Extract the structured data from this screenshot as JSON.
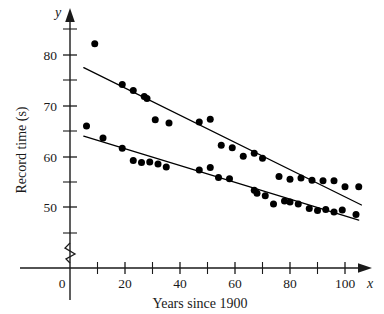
{
  "chart_data": {
    "type": "scatter",
    "title": "",
    "xlabel": "Years since 1900",
    "ylabel": "Record time (s)",
    "x_axis_name": "x",
    "y_axis_name": "y",
    "xlim": [
      0,
      108
    ],
    "ylim": [
      43,
      86
    ],
    "y_axis_break": true,
    "grid": false,
    "legend": "none",
    "x_ticks_major": [
      0,
      20,
      40,
      60,
      80,
      100
    ],
    "x_ticks_minor": [
      10,
      30,
      50,
      70,
      90
    ],
    "x_tick_labels": [
      "0",
      "20",
      "40",
      "60",
      "80",
      "100"
    ],
    "y_ticks_major": [
      50,
      60,
      70,
      80
    ],
    "y_ticks_minor": [
      45,
      55,
      65,
      75,
      85
    ],
    "y_tick_labels": [
      "50",
      "60",
      "70",
      "80"
    ],
    "series": [
      {
        "name": "upper-series",
        "points": [
          [
            9,
            82.2
          ],
          [
            19,
            74.2
          ],
          [
            23,
            73.0
          ],
          [
            27,
            71.8
          ],
          [
            28,
            71.4
          ],
          [
            31,
            67.2
          ],
          [
            36,
            66.6
          ],
          [
            47,
            66.8
          ],
          [
            51,
            67.3
          ],
          [
            55,
            62.2
          ],
          [
            59,
            61.7
          ],
          [
            63,
            60.0
          ],
          [
            67,
            60.6
          ],
          [
            70,
            59.6
          ],
          [
            76,
            56.0
          ],
          [
            80,
            55.5
          ],
          [
            84,
            55.7
          ],
          [
            88,
            55.3
          ],
          [
            92,
            55.2
          ],
          [
            96,
            55.2
          ],
          [
            100,
            54.0
          ],
          [
            105,
            54.0
          ]
        ]
      },
      {
        "name": "lower-series",
        "points": [
          [
            6,
            66.0
          ],
          [
            12,
            63.6
          ],
          [
            19,
            61.6
          ],
          [
            23,
            59.2
          ],
          [
            26,
            58.8
          ],
          [
            29,
            58.9
          ],
          [
            32,
            58.5
          ],
          [
            35,
            57.9
          ],
          [
            47,
            57.3
          ],
          [
            51,
            57.8
          ],
          [
            54,
            55.8
          ],
          [
            58,
            55.6
          ],
          [
            67,
            53.3
          ],
          [
            68,
            52.7
          ],
          [
            71,
            52.2
          ],
          [
            74,
            50.6
          ],
          [
            78,
            51.2
          ],
          [
            80,
            51.0
          ],
          [
            83,
            50.6
          ],
          [
            87,
            49.7
          ],
          [
            90,
            49.3
          ],
          [
            93,
            49.5
          ],
          [
            96,
            49.0
          ],
          [
            99,
            49.4
          ],
          [
            104,
            48.5
          ]
        ]
      }
    ],
    "fit_lines": [
      {
        "name": "upper-fit-line",
        "x_start": 5,
        "y_start": 77.5,
        "x_end": 106,
        "y_end": 50.4
      },
      {
        "name": "lower-fit-line",
        "x_start": 5,
        "y_start": 64.0,
        "x_end": 105,
        "y_end": 47.4
      }
    ]
  }
}
